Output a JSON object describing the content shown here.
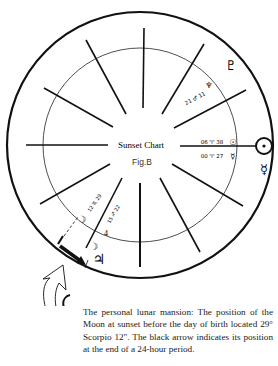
{
  "chart": {
    "title": "Sunset Chart",
    "figure_label": "Fig.B",
    "outer_circle": {
      "cx": 140,
      "cy": 145,
      "r": 133
    },
    "inner_circle": {
      "cx": 140,
      "cy": 145,
      "r": 97
    },
    "house_cusps_deg": [
      0,
      30,
      60,
      90,
      120,
      150,
      180,
      210,
      240,
      270,
      300,
      330
    ],
    "planets_outer": [
      {
        "name": "pluto",
        "glyph": "♇",
        "x": 232,
        "y": 66
      },
      {
        "name": "sun",
        "glyph": "☉",
        "x": 262,
        "y": 145
      },
      {
        "name": "mercury",
        "glyph": "☿",
        "x": 262,
        "y": 167
      },
      {
        "name": "jupiter",
        "glyph": "♃",
        "x": 99,
        "y": 262
      }
    ],
    "placements": [
      {
        "name": "neptune",
        "glyph": "♆",
        "label": "",
        "x": 208,
        "y": 88
      },
      {
        "name": "mars-degree",
        "glyph": "♂",
        "label": "21 ♂ 11",
        "x": 195,
        "y": 97
      },
      {
        "name": "sun-degree",
        "glyph": "☉",
        "label": "06 ♈ 38",
        "x": 213,
        "y": 144
      },
      {
        "name": "mercury-degree",
        "glyph": "☿",
        "label": "00 ♈ 27",
        "x": 213,
        "y": 158
      },
      {
        "name": "moon-degree",
        "glyph": "☽",
        "label": "12 ♏ 29",
        "x": 80,
        "y": 212
      },
      {
        "name": "jupiter-degree",
        "glyph": "♃",
        "label": "15 ♐ 22",
        "x": 113,
        "y": 216
      },
      {
        "name": "jupiter-inner",
        "glyph": "♃",
        "label": "4",
        "x": 106,
        "y": 233
      },
      {
        "name": "moon-end",
        "glyph": "☽",
        "label": "",
        "x": 93,
        "y": 245
      }
    ],
    "moon_glyph": "☽",
    "jupiter_glyph": "♃",
    "inner_labels": {
      "neptune": "♆",
      "mars": "21 ♂ 11",
      "sun": "06 ♈ 38",
      "mercury": "00 ♈ 27",
      "moon_a": "12 ♏ 29",
      "jupiter_a": "15 ♐ 22",
      "jupiter_inner_num": "4"
    },
    "outer_labels": {
      "pluto": "♇",
      "sun": "☉",
      "mercury": "☿",
      "jupiter": "♃",
      "moon1": "☽",
      "moon2": "☽"
    }
  },
  "caption": "The personal lunar mansion: The position of the Moon at sunset before the day of birth located 29° Scorpio 12\". The black arrow indicates its position at the end of a 24-hour period."
}
